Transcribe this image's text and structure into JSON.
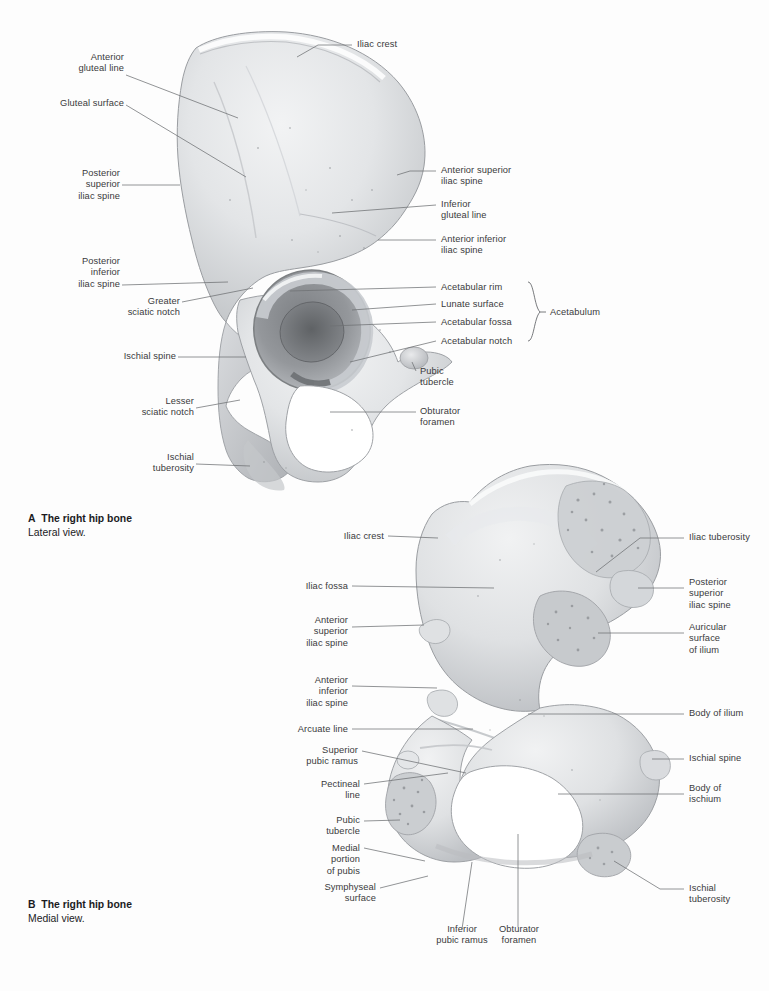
{
  "page": {
    "background": "#fdfdfd",
    "text_color": "#3a3a3c",
    "leader_color": "#6e7073",
    "bone_light": "#ececee",
    "bone_mid": "#d6d8da",
    "bone_shadow": "#a9acaf",
    "bone_dark": "#6a6d70"
  },
  "panelA": {
    "caption_letter": "A",
    "caption_title": "The right hip bone",
    "caption_subtitle": "Lateral view.",
    "view": "Lateral view",
    "labels": [
      {
        "id": "iliac-crest",
        "text": "Iliac crest"
      },
      {
        "id": "anterior-gluteal-line",
        "text": "Anterior\ngluteal line"
      },
      {
        "id": "gluteal-surface",
        "text": "Gluteal surface"
      },
      {
        "id": "posterior-superior-iliac-spine",
        "text": "Posterior\nsuperior\niliac spine"
      },
      {
        "id": "posterior-inferior-iliac-spine",
        "text": "Posterior\ninferior\niliac spine"
      },
      {
        "id": "greater-sciatic-notch",
        "text": "Greater\nsciatic notch"
      },
      {
        "id": "ischial-spine",
        "text": "Ischial spine"
      },
      {
        "id": "lesser-sciatic-notch",
        "text": "Lesser\nsciatic notch"
      },
      {
        "id": "ischial-tuberosity",
        "text": "Ischial\ntuberosity"
      },
      {
        "id": "anterior-superior-iliac-spine",
        "text": "Anterior superior\niliac spine"
      },
      {
        "id": "inferior-gluteal-line",
        "text": "Inferior\ngluteal line"
      },
      {
        "id": "anterior-inferior-iliac-spine",
        "text": "Anterior inferior\niliac spine"
      },
      {
        "id": "acetabular-rim",
        "text": "Acetabular rim"
      },
      {
        "id": "lunate-surface",
        "text": "Lunate surface"
      },
      {
        "id": "acetabular-fossa",
        "text": "Acetabular fossa"
      },
      {
        "id": "acetabular-notch",
        "text": "Acetabular notch"
      },
      {
        "id": "pubic-tubercle",
        "text": "Pubic\ntubercle"
      },
      {
        "id": "obturator-foramen",
        "text": "Obturator\nforamen"
      }
    ],
    "bracket_group": {
      "id": "acetabulum",
      "text": "Acetabulum",
      "members": [
        "Acetabular rim",
        "Lunate surface",
        "Acetabular fossa",
        "Acetabular notch"
      ]
    }
  },
  "panelB": {
    "caption_letter": "B",
    "caption_title": "The right hip bone",
    "caption_subtitle": "Medial view.",
    "view": "Medial view",
    "labels": [
      {
        "id": "iliac-crest",
        "text": "Iliac crest"
      },
      {
        "id": "iliac-fossa",
        "text": "Iliac fossa"
      },
      {
        "id": "anterior-superior-iliac-spine",
        "text": "Anterior\nsuperior\niliac spine"
      },
      {
        "id": "anterior-inferior-iliac-spine",
        "text": "Anterior\ninferior\niliac spine"
      },
      {
        "id": "arcuate-line",
        "text": "Arcuate line"
      },
      {
        "id": "superior-pubic-ramus",
        "text": "Superior\npubic ramus"
      },
      {
        "id": "pectineal-line",
        "text": "Pectineal\nline"
      },
      {
        "id": "pubic-tubercle",
        "text": "Pubic\ntubercle"
      },
      {
        "id": "medial-portion-of-pubis",
        "text": "Medial\nportion\nof pubis"
      },
      {
        "id": "symphyseal-surface",
        "text": "Symphyseal\nsurface"
      },
      {
        "id": "inferior-pubic-ramus",
        "text": "Inferior\npubic ramus"
      },
      {
        "id": "obturator-foramen",
        "text": "Obturator\nforamen"
      },
      {
        "id": "iliac-tuberosity",
        "text": "Iliac tuberosity"
      },
      {
        "id": "posterior-superior-iliac-spine",
        "text": "Posterior\nsuperior\niliac spine"
      },
      {
        "id": "auricular-surface-of-ilium",
        "text": "Auricular\nsurface\nof ilium"
      },
      {
        "id": "body-of-ilium",
        "text": "Body of ilium"
      },
      {
        "id": "ischial-spine",
        "text": "Ischial spine"
      },
      {
        "id": "body-of-ischium",
        "text": "Body of\nischium"
      },
      {
        "id": "ischial-tuberosity",
        "text": "Ischial\ntuberosity"
      }
    ]
  }
}
